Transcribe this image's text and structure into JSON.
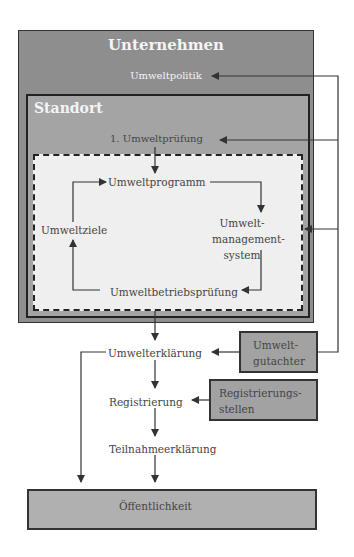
{
  "diagram": {
    "outer": {
      "title": "Unternehmen",
      "policy": "Umweltpolitik"
    },
    "site": {
      "title": "Standort",
      "review": "1. Umweltprüfung"
    },
    "cycle": {
      "program": "Umweltprogramm",
      "system_line1": "Umwelt-",
      "system_line2": "management-",
      "system_line3": "system",
      "audit": "Umweltbetriebsprüfung",
      "goals": "Umweltziele"
    },
    "statement": "Umwelterklärung",
    "verifier_line1": "Umwelt-",
    "verifier_line2": "gutachter",
    "registration": "Registrierung",
    "registry_line1": "Registrierungs-",
    "registry_line2": "stellen",
    "participation": "Teilnahmeerklärung",
    "public": "Öffentlichkeit"
  },
  "colors": {
    "outer_fill": "#8e8e8e",
    "site_fill": "#a4a4a4",
    "cycle_fill": "#efefef",
    "box_fill": "#a2a2a2",
    "line": "#333333"
  }
}
